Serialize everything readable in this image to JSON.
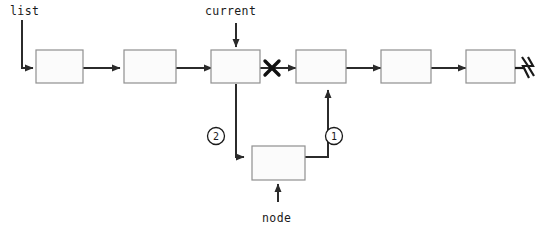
{
  "diagram": {
    "background_color": "#ffffff",
    "stroke_color": "#2b2b2b",
    "box_fill_color": "#fbfbfb",
    "box_border_color": "#8f8f8f",
    "labels": {
      "list": "list",
      "current": "current",
      "node": "node"
    },
    "step_markers": [
      {
        "id": "step-1",
        "text": "1"
      },
      {
        "id": "step-2",
        "text": "2"
      }
    ],
    "list_nodes": [
      {
        "id": "node-1",
        "text": ""
      },
      {
        "id": "node-2",
        "text": ""
      },
      {
        "id": "node-3",
        "text": ""
      },
      {
        "id": "node-4",
        "text": ""
      },
      {
        "id": "node-5",
        "text": ""
      },
      {
        "id": "node-6",
        "text": ""
      }
    ],
    "new_node": {
      "id": "new-node",
      "text": ""
    },
    "icons": {
      "broken_link": "x-cross-icon",
      "null_terminator": "null-terminator-icon"
    }
  }
}
